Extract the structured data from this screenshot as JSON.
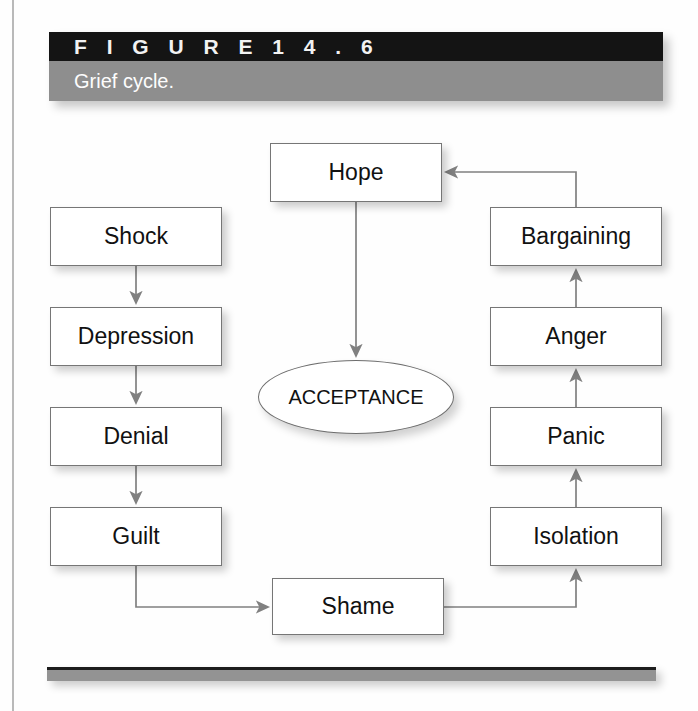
{
  "figure": {
    "number_label": "F I G U R E   1 4 . 6",
    "caption": "Grief cycle.",
    "header_black_color": "#141414",
    "header_gray_color": "#8e8e8e",
    "rule_color": "#939393"
  },
  "diagram": {
    "type": "flowchart",
    "title": "Grief cycle",
    "nodes": [
      {
        "id": "hope",
        "label": "Hope",
        "shape": "rect",
        "x": 270,
        "y": 143,
        "w": 172,
        "h": 59
      },
      {
        "id": "shock",
        "label": "Shock",
        "shape": "rect",
        "x": 50,
        "y": 207,
        "w": 172,
        "h": 59
      },
      {
        "id": "bargaining",
        "label": "Bargaining",
        "shape": "rect",
        "x": 490,
        "y": 207,
        "w": 172,
        "h": 59
      },
      {
        "id": "depression",
        "label": "Depression",
        "shape": "rect",
        "x": 50,
        "y": 307,
        "w": 172,
        "h": 59
      },
      {
        "id": "anger",
        "label": "Anger",
        "shape": "rect",
        "x": 490,
        "y": 307,
        "w": 172,
        "h": 59
      },
      {
        "id": "acceptance",
        "label": "ACCEPTANCE",
        "shape": "ellipse",
        "x": 258,
        "y": 360,
        "w": 196,
        "h": 74
      },
      {
        "id": "denial",
        "label": "Denial",
        "shape": "rect",
        "x": 50,
        "y": 407,
        "w": 172,
        "h": 59
      },
      {
        "id": "panic",
        "label": "Panic",
        "shape": "rect",
        "x": 490,
        "y": 407,
        "w": 172,
        "h": 59
      },
      {
        "id": "guilt",
        "label": "Guilt",
        "shape": "rect",
        "x": 50,
        "y": 507,
        "w": 172,
        "h": 59
      },
      {
        "id": "isolation",
        "label": "Isolation",
        "shape": "rect",
        "x": 490,
        "y": 507,
        "w": 172,
        "h": 59
      },
      {
        "id": "shame",
        "label": "Shame",
        "shape": "rect",
        "x": 272,
        "y": 578,
        "w": 172,
        "h": 57
      }
    ],
    "edges": [
      {
        "from": "shock",
        "to": "depression",
        "style": "straight-down"
      },
      {
        "from": "depression",
        "to": "denial",
        "style": "straight-down"
      },
      {
        "from": "denial",
        "to": "guilt",
        "style": "straight-down"
      },
      {
        "from": "guilt",
        "to": "shame",
        "style": "elbow-right"
      },
      {
        "from": "shame",
        "to": "isolation",
        "style": "elbow-up"
      },
      {
        "from": "isolation",
        "to": "panic",
        "style": "straight-up"
      },
      {
        "from": "panic",
        "to": "anger",
        "style": "straight-up"
      },
      {
        "from": "anger",
        "to": "bargaining",
        "style": "straight-up"
      },
      {
        "from": "bargaining",
        "to": "hope",
        "style": "elbow-left"
      },
      {
        "from": "hope",
        "to": "acceptance",
        "style": "straight-down"
      }
    ],
    "line_color": "#6f6f6f",
    "node_fill": "#ffffff",
    "node_border": "#767676"
  }
}
